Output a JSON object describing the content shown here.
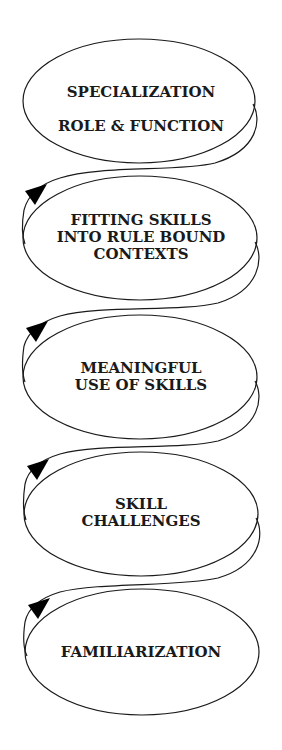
{
  "diagram": {
    "type": "spiral-stages",
    "direction": "bottom-to-top",
    "stages": [
      {
        "lines": [
          "SPECIALIZATION",
          "ROLE & FUNCTION"
        ]
      },
      {
        "lines": [
          "FITTING SKILLS",
          "INTO RULE BOUND",
          "CONTEXTS"
        ]
      },
      {
        "lines": [
          "MEANINGFUL",
          "USE OF SKILLS"
        ]
      },
      {
        "lines": [
          "SKILL",
          "CHALLENGES"
        ]
      },
      {
        "lines": [
          "FAMILIARIZATION"
        ]
      }
    ],
    "colors": {
      "stroke": "#1a1a1a",
      "arrow": "#000000",
      "background": "#ffffff"
    }
  }
}
